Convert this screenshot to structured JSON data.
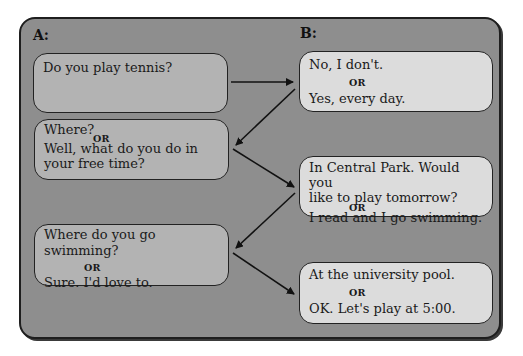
{
  "columns": {
    "a_label": "A:",
    "b_label": "B:"
  },
  "a_bubbles": [
    {
      "lines": [
        "Do you play tennis?"
      ]
    },
    {
      "lines": [
        "Where?",
        "OR",
        "Well, what do you do in",
        "your free time?"
      ]
    },
    {
      "lines": [
        "Where do you go swimming?",
        "OR",
        "Sure. I'd love to."
      ]
    }
  ],
  "b_bubbles": [
    {
      "lines": [
        "No, I don't.",
        "OR",
        "Yes, every day."
      ]
    },
    {
      "lines": [
        "In Central Park. Would you",
        "like to play tomorrow?",
        "OR",
        "I read and I go swimming."
      ]
    },
    {
      "lines": [
        "At the university pool.",
        "OR",
        "OK. Let's play at 5:00."
      ]
    }
  ],
  "colors": {
    "panel": "#8e8e8e",
    "a_bubble": "#b3b3b3",
    "b_bubble": "#dcdcdc",
    "border": "#1e1e1e"
  }
}
